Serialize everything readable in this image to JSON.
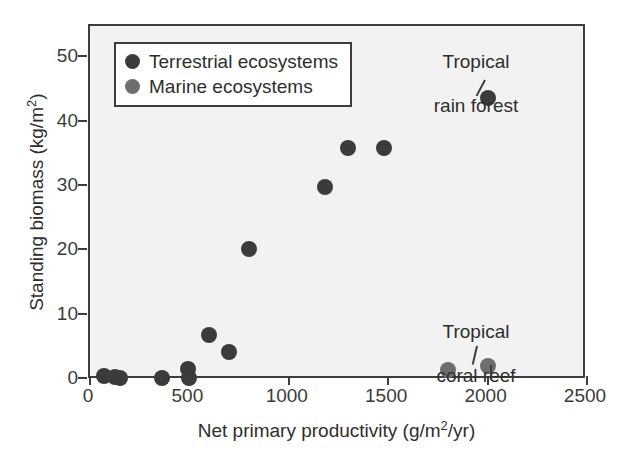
{
  "chart_data": {
    "type": "scatter",
    "title": "",
    "xlabel": "Net primary productivity (g/m2/yr)",
    "ylabel": "Standing biomass (kg/m2)",
    "xlabel_parts": {
      "base": "Net primary productivity (g/m",
      "sup": "2",
      "tail": "/yr)"
    },
    "ylabel_parts": {
      "base": "Standing biomass (kg/m",
      "sup": "2",
      "tail": ")"
    },
    "xlim": [
      0,
      2500
    ],
    "ylim": [
      0,
      55
    ],
    "xticks": [
      0,
      500,
      1000,
      1500,
      2000,
      2500
    ],
    "yticks": [
      0,
      10,
      20,
      30,
      40,
      50
    ],
    "xtick_labels": [
      "0",
      "500",
      "1000",
      "1500",
      "2000",
      "2500"
    ],
    "ytick_labels": [
      "0",
      "10",
      "20",
      "30",
      "40",
      "50"
    ],
    "grid": false,
    "legend_position": "upper-left-inside",
    "series": [
      {
        "name": "Terrestrial ecosystems",
        "color": "#3b3b3b",
        "points": [
          {
            "x": 70,
            "y": 0.6
          },
          {
            "x": 125,
            "y": 0.5
          },
          {
            "x": 150,
            "y": 0.3
          },
          {
            "x": 360,
            "y": 0.3
          },
          {
            "x": 495,
            "y": 1.7
          },
          {
            "x": 500,
            "y": 0.3
          },
          {
            "x": 600,
            "y": 7.0
          },
          {
            "x": 700,
            "y": 4.4
          },
          {
            "x": 800,
            "y": 20.3
          },
          {
            "x": 1180,
            "y": 30.0
          },
          {
            "x": 1300,
            "y": 36.0
          },
          {
            "x": 1480,
            "y": 36.0
          },
          {
            "x": 2000,
            "y": 43.8
          }
        ]
      },
      {
        "name": "Marine ecosystems",
        "color": "#6e6e6e",
        "points": [
          {
            "x": 1800,
            "y": 1.5
          },
          {
            "x": 2000,
            "y": 2.2
          }
        ]
      }
    ],
    "annotations": [
      {
        "label": "Tropical\nrain forest",
        "target_x": 2000,
        "target_y": 43.8
      },
      {
        "label": "Tropical\ncoral reef",
        "target_x": 2000,
        "target_y": 2.2
      }
    ]
  },
  "legend": {
    "items": [
      {
        "label": "Terrestrial ecosystems",
        "color": "#3b3b3b",
        "marker": "filled-circle"
      },
      {
        "label": "Marine ecosystems",
        "color": "#6e6e6e",
        "marker": "filled-circle"
      }
    ]
  },
  "annotations": {
    "rain_forest": {
      "line1": "Tropical",
      "line2": "rain forest"
    },
    "coral_reef": {
      "line1": "Tropical",
      "line2": "coral reef"
    }
  }
}
